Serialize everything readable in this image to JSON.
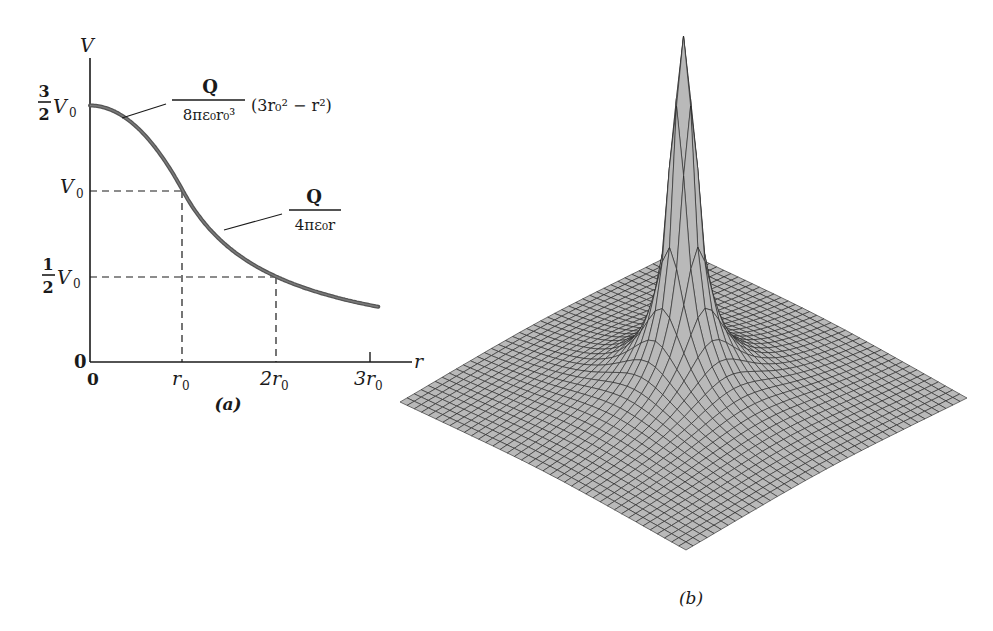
{
  "figure": {
    "panel_a": {
      "caption": "(a)",
      "y_axis_label": "V",
      "x_axis_label": "r",
      "y_ticks": [
        {
          "label_num": "3",
          "label_den": "2",
          "label": "V",
          "sub": "0",
          "value": 1.5
        },
        {
          "label": "V",
          "sub": "0",
          "value": 1.0
        },
        {
          "label_num": "1",
          "label_den": "2",
          "label": "V",
          "sub": "0",
          "value": 0.5
        },
        {
          "label": "0",
          "value": 0
        }
      ],
      "x_ticks": [
        {
          "label": "0",
          "value": 0
        },
        {
          "label": "r",
          "sub": "0",
          "value": 1
        },
        {
          "label": "2r",
          "sub": "0",
          "value": 2
        },
        {
          "label": "3r",
          "sub": "0",
          "value": 3
        }
      ],
      "annotation_inside": {
        "numerator": "Q",
        "denominator": "8πε₀r₀³",
        "factor": "(3r₀² − r²)"
      },
      "annotation_outside": {
        "numerator": "Q",
        "denominator": "4πε₀r"
      }
    },
    "panel_b": {
      "caption": "(b)",
      "surface_fill": "#b9b9b9",
      "mesh_color": "#222222",
      "grid_n": 40
    }
  },
  "chart_data": [
    {
      "type": "line",
      "title": "",
      "xlabel": "r",
      "ylabel": "V",
      "x_units": "r0",
      "y_units": "V0",
      "xlim": [
        0,
        3.3
      ],
      "ylim": [
        0,
        1.6
      ],
      "grid": false,
      "x_tick_labels": [
        "0",
        "r0",
        "2r0",
        "3r0"
      ],
      "y_tick_labels": [
        "0",
        "1/2 V0",
        "V0",
        "3/2 V0"
      ],
      "series": [
        {
          "name": "Q/(8πε0 r0^3) (3r0^2 − r^2)  (r ≤ r0)",
          "x": [
            0,
            0.1,
            0.2,
            0.3,
            0.4,
            0.5,
            0.6,
            0.7,
            0.8,
            0.9,
            1.0
          ],
          "y": [
            1.5,
            1.495,
            1.48,
            1.455,
            1.42,
            1.375,
            1.32,
            1.255,
            1.18,
            1.095,
            1.0
          ]
        },
        {
          "name": "Q/(4πε0 r)  (r ≥ r0)",
          "x": [
            1.0,
            1.25,
            1.5,
            1.75,
            2.0,
            2.25,
            2.5,
            2.75,
            3.0,
            3.1
          ],
          "y": [
            1.0,
            0.8,
            0.667,
            0.571,
            0.5,
            0.444,
            0.4,
            0.364,
            0.333,
            0.323
          ]
        }
      ],
      "guides": [
        {
          "from": [
            0,
            1.0
          ],
          "to": [
            1,
            1.0
          ],
          "style": "dashed"
        },
        {
          "from": [
            1,
            0
          ],
          "to": [
            1,
            1.0
          ],
          "style": "dashed"
        },
        {
          "from": [
            0,
            0.5
          ],
          "to": [
            2,
            0.5
          ],
          "style": "dashed"
        },
        {
          "from": [
            2,
            0
          ],
          "to": [
            2,
            0.5
          ],
          "style": "dashed"
        }
      ]
    },
    {
      "type": "surface",
      "title": "",
      "description": "3D wireframe surface of potential V(x,y) for uniformly charged sphere; sharp central peak falling off as 1/r",
      "caption": "(b)"
    }
  ]
}
